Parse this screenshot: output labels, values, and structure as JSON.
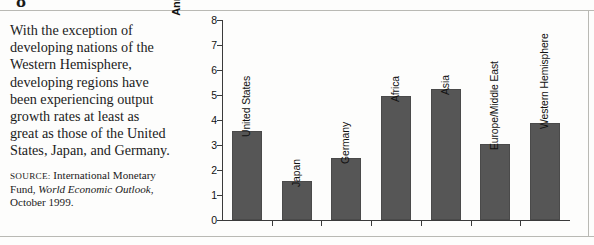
{
  "page": {
    "heading_stub": "8",
    "caption_text": "With the exception of developing nations of the Western Hemisphere, developing regions have been experiencing output growth rates at least as great as those of the United States, Japan, and Germany.",
    "source_prefix": "SOURCE:",
    "source_text_before": " International Monetary Fund, ",
    "source_publication": "World Economic Outlook",
    "source_text_after": ", October 1999."
  },
  "colors": {
    "bar_fill": "#565656",
    "axis": "#3b3b3b",
    "rule": "#b9b9b4",
    "text": "#1b1b1b",
    "page_background": "#fdfdfc"
  },
  "chart_data": {
    "type": "bar",
    "title": "",
    "xlabel": "",
    "ylabel": "Annual growth rate (percent)",
    "ylim": [
      0,
      8
    ],
    "yticks": [
      0,
      1,
      2,
      3,
      4,
      5,
      6,
      7,
      8
    ],
    "ytick_labels": [
      "0",
      "1",
      "2",
      "3",
      "4",
      "5",
      "6",
      "7",
      "8"
    ],
    "grid": false,
    "legend": false,
    "categories": [
      "United States",
      "Japan",
      "Germany",
      "Africa",
      "Asia",
      "Europe/Middle East",
      "Western Hemisphere"
    ],
    "values": [
      3.55,
      1.55,
      2.5,
      4.95,
      5.25,
      3.05,
      3.9
    ]
  }
}
